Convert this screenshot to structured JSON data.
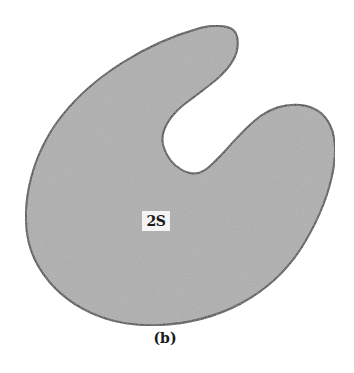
{
  "figure": {
    "region_label": "2S",
    "caption": "(b)",
    "colors": {
      "fill": "#a9a9a9",
      "outline": "#1e1e1e",
      "background": "#ffffff"
    }
  }
}
